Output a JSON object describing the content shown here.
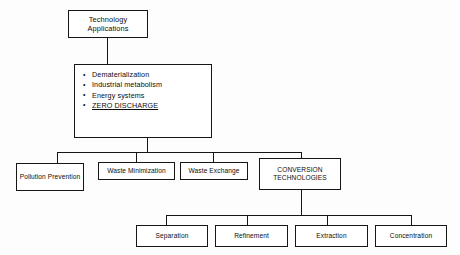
{
  "diagram": {
    "title": "Technology Applications",
    "root": {
      "label": "Technology Applications"
    },
    "detail_box": {
      "bullets": [
        {
          "text": "Dematerialization",
          "underlined": false
        },
        {
          "text": "Industrial metabolism",
          "underlined": false
        },
        {
          "text": "Energy systems",
          "underlined": false
        },
        {
          "text": "ZERO DISCHARGE",
          "underlined": true
        }
      ]
    },
    "level_two": [
      {
        "label": "Pollution Prevention"
      },
      {
        "label": "Waste Minimization"
      },
      {
        "label": "Waste Exchange"
      },
      {
        "label": "CONVERSION TECHNOLOGIES"
      }
    ],
    "level_three": [
      {
        "label": "Separation"
      },
      {
        "label": "Refinement"
      },
      {
        "label": "Extraction"
      },
      {
        "label": "Concentration"
      }
    ],
    "colors": {
      "line": "#151515",
      "box_fill": "#ffffff",
      "text": "#0d0d0d",
      "background": "#fdfdfd"
    }
  }
}
